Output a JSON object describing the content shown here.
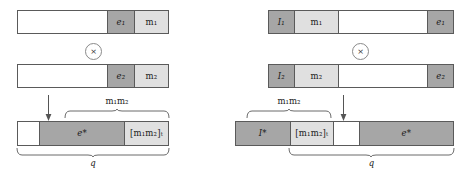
{
  "figure": {
    "type": "diagram",
    "title": "",
    "operator_symbol": "×",
    "colors": {
      "white": "#ffffff",
      "light_gray": "#e0e0e0",
      "dark_gray": "#a6a6a6",
      "outline": "#5a5a5a",
      "brace": "#6b6b6b",
      "text": "#1a1a1a"
    }
  },
  "left_panel": {
    "name": "little-endian-layout",
    "bar1": {
      "name": "operand-1-bar",
      "segments": [
        {
          "fill": "white",
          "label": ""
        },
        {
          "fill": "dark",
          "label": "e₁",
          "base": "e",
          "subscript": "1"
        },
        {
          "fill": "light",
          "label": "m₁",
          "base": "m",
          "subscript": "1"
        }
      ]
    },
    "operator": {
      "symbol": "×",
      "name": "multiply-operator"
    },
    "bar2": {
      "name": "operand-2-bar",
      "segments": [
        {
          "fill": "white",
          "label": ""
        },
        {
          "fill": "dark",
          "label": "e₂",
          "base": "e",
          "subscript": "2"
        },
        {
          "fill": "light",
          "label": "m₂",
          "base": "m",
          "subscript": "2"
        }
      ]
    },
    "arrow": {
      "name": "result-arrow",
      "direction": "down"
    },
    "top_brace_label": "m₁m₂",
    "result_bar": {
      "name": "result-bar",
      "segments": [
        {
          "fill": "white",
          "label": ""
        },
        {
          "fill": "dark",
          "label": "e*"
        },
        {
          "fill": "light",
          "label": "[m₁m₂]ₜ"
        }
      ]
    },
    "bottom_brace_label": "q"
  },
  "right_panel": {
    "name": "big-endian-layout",
    "bar1": {
      "name": "operand-1-bar",
      "segments": [
        {
          "fill": "dark",
          "label": "I₁",
          "base": "I",
          "subscript": "1"
        },
        {
          "fill": "light",
          "label": "m₁",
          "base": "m",
          "subscript": "1"
        },
        {
          "fill": "white",
          "label": ""
        },
        {
          "fill": "dark",
          "label": "e₁",
          "base": "e",
          "subscript": "1"
        }
      ]
    },
    "operator": {
      "symbol": "×",
      "name": "multiply-operator"
    },
    "bar2": {
      "name": "operand-2-bar",
      "segments": [
        {
          "fill": "dark",
          "label": "I₂",
          "base": "I",
          "subscript": "2"
        },
        {
          "fill": "light",
          "label": "m₂",
          "base": "m",
          "subscript": "2"
        },
        {
          "fill": "white",
          "label": ""
        },
        {
          "fill": "dark",
          "label": "e₂",
          "base": "e",
          "subscript": "2"
        }
      ]
    },
    "arrow": {
      "name": "result-arrow",
      "direction": "down"
    },
    "top_brace_label": "m₁m₂",
    "result_bar": {
      "name": "result-bar",
      "segments": [
        {
          "fill": "dark",
          "label": "I*"
        },
        {
          "fill": "light",
          "label": "[m₁m₂]ₜ"
        },
        {
          "fill": "white",
          "label": ""
        },
        {
          "fill": "dark",
          "label": "e*"
        }
      ]
    },
    "bottom_brace_label": "q"
  }
}
